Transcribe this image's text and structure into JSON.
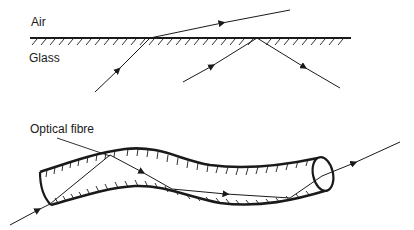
{
  "labels": {
    "air": "Air",
    "glass": "Glass",
    "optical_fibre": "Optical fibre"
  },
  "panels": [
    {
      "id": "refraction-and-tir",
      "description": "Glass–air boundary showing a refracted ray and a totally internally reflected ray",
      "media": [
        "Air",
        "Glass"
      ],
      "rays": [
        {
          "name": "refracted-ray",
          "path": [
            [
              95,
              92
            ],
            [
              150,
              38
            ],
            [
              290,
              10
            ]
          ]
        },
        {
          "name": "totally-internally-reflected-ray",
          "path": [
            [
              183,
              82
            ],
            [
              257,
              38
            ],
            [
              340,
              88
            ]
          ]
        }
      ]
    },
    {
      "id": "optical-fibre",
      "description": "Light entering a curved optical fibre and travelling along it by total internal reflection",
      "label": "Optical fibre",
      "rays": [
        {
          "name": "guided-ray",
          "path": [
            [
              10,
              225
            ],
            [
              50,
              204
            ],
            [
              110,
              155
            ],
            [
              290,
              198
            ],
            [
              322,
              176
            ],
            [
              400,
              142
            ]
          ]
        }
      ]
    }
  ],
  "colors": {
    "ink": "#1a1a1a",
    "background": "#ffffff"
  }
}
